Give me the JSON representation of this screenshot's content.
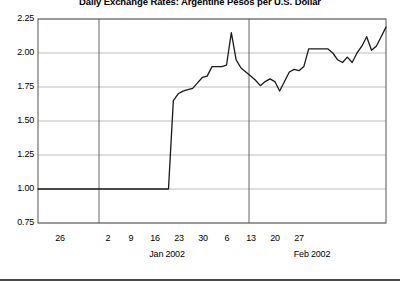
{
  "chart_data": {
    "type": "line",
    "title": "Daily Exchange Rates: Argentine Pesos per U.S. Dollar",
    "xlabel": "",
    "ylabel": "",
    "ylim": [
      0.75,
      2.25
    ],
    "grid": true,
    "legend": false,
    "yticks": [
      "2.25",
      "2.00",
      "1.75",
      "1.50",
      "1.25",
      "1.00",
      "0.75"
    ],
    "ytick_values": [
      2.25,
      2.0,
      1.75,
      1.5,
      1.25,
      1.0,
      0.75
    ],
    "xticks": [
      "26",
      "2",
      "9",
      "16",
      "23",
      "30",
      "6",
      "13",
      "20",
      "27"
    ],
    "xtick_positions": [
      60,
      108,
      131,
      155,
      179,
      203,
      227,
      251,
      275,
      299
    ],
    "month_labels": [
      "Jan 2002",
      "Feb 2002"
    ],
    "month_divider_positions": [
      99,
      249
    ],
    "series": [
      {
        "name": "ARS per USD",
        "x": [
          0,
          1,
          2,
          3,
          4,
          5,
          6,
          7,
          8,
          9,
          10,
          11,
          12,
          13,
          14,
          15,
          16,
          17,
          18,
          19,
          20,
          21,
          22,
          23,
          24,
          25,
          26,
          27,
          28,
          29,
          30,
          31,
          32,
          33,
          34,
          35,
          36,
          37,
          38,
          39,
          40,
          41,
          42,
          43,
          44,
          45,
          46,
          47,
          48,
          49,
          50,
          51,
          52,
          53,
          54,
          55,
          56,
          57,
          58,
          59,
          60,
          61,
          62,
          63,
          64,
          65,
          66,
          67,
          68,
          69,
          70,
          71,
          72
        ],
        "values": [
          1.0,
          1.0,
          1.0,
          1.0,
          1.0,
          1.0,
          1.0,
          1.0,
          1.0,
          1.0,
          1.0,
          1.0,
          1.0,
          1.0,
          1.0,
          1.0,
          1.0,
          1.0,
          1.0,
          1.0,
          1.0,
          1.0,
          1.0,
          1.0,
          1.0,
          1.0,
          1.0,
          1.0,
          1.65,
          1.7,
          1.72,
          1.73,
          1.74,
          1.78,
          1.82,
          1.83,
          1.9,
          1.9,
          1.9,
          1.91,
          2.15,
          1.95,
          1.89,
          1.86,
          1.83,
          1.8,
          1.76,
          1.79,
          1.81,
          1.79,
          1.72,
          1.79,
          1.86,
          1.88,
          1.87,
          1.9,
          2.03,
          2.03,
          2.03,
          2.03,
          2.03,
          2.0,
          1.95,
          1.93,
          1.97,
          1.93,
          2.0,
          2.05,
          2.12,
          2.02,
          2.05,
          2.12,
          2.19
        ]
      }
    ],
    "line_color": "#1a1a1a",
    "axis_color": "#555555",
    "grid_color": "#b8b8b8",
    "background": "#ffffff"
  }
}
